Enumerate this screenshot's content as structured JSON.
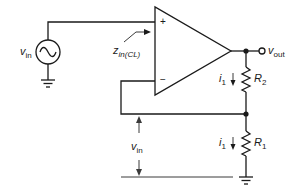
{
  "diagram": {
    "type": "non-inverting op-amp amplifier",
    "components": {
      "source": {
        "symbol": "v",
        "subscript": "in",
        "icon": "ac-source-icon"
      },
      "opamp": {
        "plus_label": "+",
        "minus_label": "−"
      },
      "r2": {
        "symbol": "R",
        "subscript": "2"
      },
      "r1": {
        "symbol": "R",
        "subscript": "1"
      },
      "output": {
        "symbol": "v",
        "subscript": "out"
      }
    },
    "annotations": {
      "zin": {
        "symbol": "z",
        "subscript": "in(CL)"
      },
      "i1_top": {
        "symbol": "i",
        "subscript": "1"
      },
      "i1_bottom": {
        "symbol": "i",
        "subscript": "1"
      },
      "vin_feedback": {
        "symbol": "v",
        "subscript": "in"
      }
    },
    "colors": {
      "line": "#1a1a1a",
      "background": "#ffffff"
    }
  }
}
